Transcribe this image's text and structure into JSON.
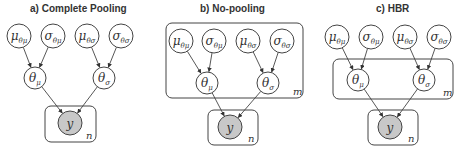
{
  "figure": {
    "panels": [
      {
        "id": "a",
        "title": "a) Complete Pooling",
        "title_x": 30,
        "nodes": [
          {
            "id": "mu_theta_mu",
            "main": "μ",
            "sub": "θμ",
            "cx": 19,
            "cy": 36,
            "r": 12,
            "fill": "#ffffff"
          },
          {
            "id": "sigma_theta_mu",
            "main": "σ",
            "sub": "θμ",
            "cx": 53,
            "cy": 36,
            "r": 12,
            "fill": "#ffffff"
          },
          {
            "id": "mu_theta_sigma",
            "main": "μ",
            "sub": "θσ",
            "cx": 87,
            "cy": 36,
            "r": 12,
            "fill": "#ffffff"
          },
          {
            "id": "sigma_theta_sigma",
            "main": "σ",
            "sub": "θσ",
            "cx": 121,
            "cy": 36,
            "r": 12,
            "fill": "#ffffff"
          },
          {
            "id": "theta_mu",
            "main": "θ",
            "sub": "μ",
            "cx": 35,
            "cy": 78,
            "r": 11,
            "fill": "#ffffff"
          },
          {
            "id": "theta_sigma",
            "main": "θ",
            "sub": "σ",
            "cx": 104,
            "cy": 78,
            "r": 11,
            "fill": "#ffffff"
          },
          {
            "id": "y",
            "main": "y",
            "sub": "",
            "cx": 70,
            "cy": 123,
            "r": 12,
            "fill": "#c8c8c8"
          }
        ],
        "edges": [
          [
            "mu_theta_mu",
            "theta_mu"
          ],
          [
            "sigma_theta_mu",
            "theta_mu"
          ],
          [
            "mu_theta_sigma",
            "theta_sigma"
          ],
          [
            "sigma_theta_sigma",
            "theta_sigma"
          ],
          [
            "theta_mu",
            "y"
          ],
          [
            "theta_sigma",
            "y"
          ]
        ],
        "plates": [
          {
            "label": "n",
            "x": 45,
            "y": 106,
            "w": 51,
            "h": 36
          }
        ]
      },
      {
        "id": "b",
        "title": "b) No-pooling",
        "title_x": 200,
        "nodes": [
          {
            "id": "mu_theta_mu",
            "main": "μ",
            "sub": "θμ",
            "cx": 181,
            "cy": 41,
            "r": 12,
            "fill": "#ffffff"
          },
          {
            "id": "sigma_theta_mu",
            "main": "σ",
            "sub": "θμ",
            "cx": 214,
            "cy": 41,
            "r": 12,
            "fill": "#ffffff"
          },
          {
            "id": "mu_theta_sigma",
            "main": "μ",
            "sub": "θσ",
            "cx": 248,
            "cy": 41,
            "r": 12,
            "fill": "#ffffff"
          },
          {
            "id": "sigma_theta_sigma",
            "main": "σ",
            "sub": "θσ",
            "cx": 282,
            "cy": 41,
            "r": 12,
            "fill": "#ffffff"
          },
          {
            "id": "theta_mu",
            "main": "θ",
            "sub": "μ",
            "cx": 207,
            "cy": 83,
            "r": 11,
            "fill": "#ffffff"
          },
          {
            "id": "theta_sigma",
            "main": "θ",
            "sub": "σ",
            "cx": 268,
            "cy": 83,
            "r": 11,
            "fill": "#ffffff"
          },
          {
            "id": "y",
            "main": "y",
            "sub": "",
            "cx": 230,
            "cy": 127,
            "r": 12,
            "fill": "#c8c8c8"
          }
        ],
        "edges": [
          [
            "mu_theta_mu",
            "theta_mu"
          ],
          [
            "sigma_theta_mu",
            "theta_mu"
          ],
          [
            "mu_theta_sigma",
            "theta_sigma"
          ],
          [
            "sigma_theta_sigma",
            "theta_sigma"
          ],
          [
            "theta_mu",
            "y"
          ],
          [
            "theta_sigma",
            "y"
          ]
        ],
        "plates": [
          {
            "label": "m",
            "x": 166,
            "y": 23,
            "w": 137,
            "h": 75
          },
          {
            "label": "n",
            "x": 208,
            "y": 110,
            "w": 50,
            "h": 35
          }
        ]
      },
      {
        "id": "c",
        "title": "c) HBR",
        "title_x": 376,
        "nodes": [
          {
            "id": "mu_theta_mu",
            "main": "μ",
            "sub": "θμ",
            "cx": 337,
            "cy": 37,
            "r": 12,
            "fill": "#ffffff"
          },
          {
            "id": "sigma_theta_mu",
            "main": "σ",
            "sub": "θμ",
            "cx": 371,
            "cy": 37,
            "r": 12,
            "fill": "#ffffff"
          },
          {
            "id": "mu_theta_sigma",
            "main": "μ",
            "sub": "θσ",
            "cx": 405,
            "cy": 37,
            "r": 12,
            "fill": "#ffffff"
          },
          {
            "id": "sigma_theta_sigma",
            "main": "σ",
            "sub": "θσ",
            "cx": 439,
            "cy": 37,
            "r": 12,
            "fill": "#ffffff"
          },
          {
            "id": "theta_mu",
            "main": "θ",
            "sub": "μ",
            "cx": 358,
            "cy": 80,
            "r": 11,
            "fill": "#ffffff"
          },
          {
            "id": "theta_sigma",
            "main": "θ",
            "sub": "σ",
            "cx": 424,
            "cy": 80,
            "r": 11,
            "fill": "#ffffff"
          },
          {
            "id": "y",
            "main": "y",
            "sub": "",
            "cx": 390,
            "cy": 127,
            "r": 12,
            "fill": "#c8c8c8"
          }
        ],
        "edges": [
          [
            "mu_theta_mu",
            "theta_mu"
          ],
          [
            "sigma_theta_mu",
            "theta_mu"
          ],
          [
            "mu_theta_sigma",
            "theta_sigma"
          ],
          [
            "sigma_theta_sigma",
            "theta_sigma"
          ],
          [
            "theta_mu",
            "y"
          ],
          [
            "theta_sigma",
            "y"
          ]
        ],
        "plates": [
          {
            "label": "m",
            "x": 333,
            "y": 59,
            "w": 120,
            "h": 40
          },
          {
            "label": "n",
            "x": 368,
            "y": 110,
            "w": 50,
            "h": 35
          }
        ]
      }
    ],
    "colors": {
      "stroke": "#444444",
      "observed_fill": "#c8c8c8",
      "latent_fill": "#ffffff"
    }
  }
}
